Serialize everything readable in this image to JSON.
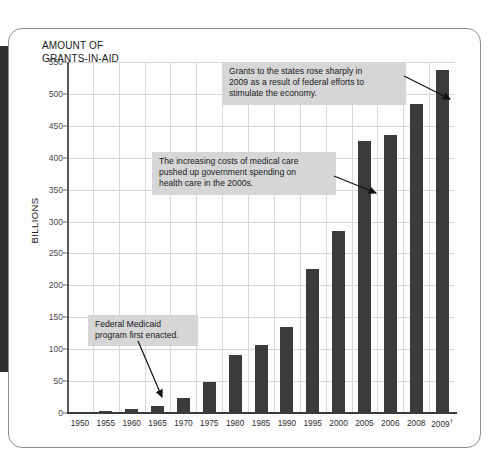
{
  "figure": {
    "title": "AMOUNT OF\nGRANTS-IN-AID",
    "y_axis_title": "BILLIONS",
    "panel_background": "#fdfdfd",
    "bar_color": "#3b3b3d",
    "grid_color": "#d8d8d8",
    "annotation_background": "#d6d6d6",
    "spine_color": "#2f2f30"
  },
  "chart_data": {
    "type": "bar",
    "title": "AMOUNT OF GRANTS-IN-AID",
    "xlabel": "",
    "ylabel": "BILLIONS",
    "ylim": [
      0,
      550
    ],
    "ytick_step": 50,
    "grid": true,
    "legend": "none",
    "categories": [
      "1950",
      "1955",
      "1960",
      "1965",
      "1970",
      "1975",
      "1980",
      "1985",
      "1990",
      "1995",
      "2000",
      "2005",
      "2006",
      "2008",
      "2009"
    ],
    "category_labels": [
      "1950",
      "1955",
      "1960",
      "1965",
      "1970",
      "1975",
      "1980",
      "1985",
      "1990",
      "1995",
      "2000",
      "2005",
      "2006",
      "2008",
      "2009†"
    ],
    "values": [
      2,
      3,
      7,
      11,
      24,
      49,
      91,
      106,
      135,
      225,
      285,
      426,
      436,
      484,
      538
    ],
    "yticks": [
      0,
      50,
      100,
      150,
      200,
      250,
      300,
      350,
      400,
      450,
      500,
      550
    ],
    "ytick_labels": [
      "0",
      "50",
      "100",
      "150",
      "200",
      "250",
      "300",
      "350",
      "400",
      "450",
      "500",
      "550"
    ]
  },
  "annotations": [
    {
      "id": "stimulus-note",
      "text": "Grants to the states rose sharply in\n2009 as a result of federal efforts to\nstimulate the economy.",
      "target_category": "2009"
    },
    {
      "id": "medical-costs-note",
      "text": "The increasing costs of medical care\npushed up government spending on\nhealth care in the 2000s.",
      "target_category": "2005"
    },
    {
      "id": "medicaid-note",
      "text": "Federal Medicaid\nprogram first enacted.",
      "target_category": "1965"
    }
  ]
}
